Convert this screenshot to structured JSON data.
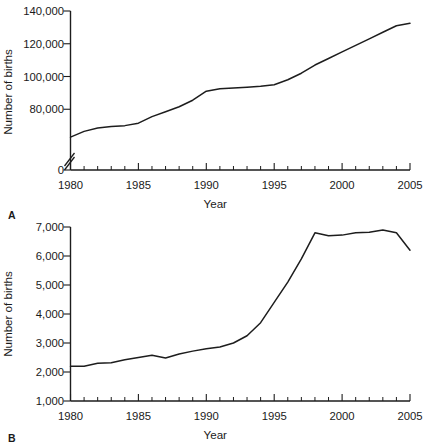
{
  "figure": {
    "background_color": "#ffffff",
    "line_color": "#1d1d1d",
    "panels": [
      {
        "letter": "A",
        "ylabel": "Number of births",
        "xlabel": "Year"
      },
      {
        "letter": "B",
        "ylabel": "Number of births",
        "xlabel": "Year"
      }
    ]
  },
  "chart_data": [
    {
      "type": "line",
      "panel": "A",
      "title": "",
      "xlabel": "Year",
      "ylabel": "Number of births",
      "xlim": [
        1980,
        2005
      ],
      "ylim": [
        0,
        140000
      ],
      "axis_break": true,
      "axis_break_note": "y-axis broken between 0 and the lowest plotted value",
      "grid": false,
      "legend": "none",
      "ytick_labels": [
        "140,000",
        "120,000",
        "100,000",
        "80,000",
        "0"
      ],
      "ytick_values": [
        140000,
        120000,
        100000,
        80000,
        0
      ],
      "xtick_labels": [
        "1980",
        "1985",
        "1990",
        "1995",
        "2000",
        "2005"
      ],
      "xtick_values": [
        1980,
        1985,
        1990,
        1995,
        2000,
        2005
      ],
      "xtick_minor_step": 1,
      "x": [
        1980,
        1981,
        1982,
        1983,
        1984,
        1985,
        1986,
        1987,
        1988,
        1989,
        1990,
        1991,
        1992,
        1993,
        1994,
        1995,
        1996,
        1997,
        1998,
        1999,
        2000,
        2001,
        2002,
        2003,
        2004,
        2005
      ],
      "values": [
        63000,
        66500,
        68500,
        69500,
        70000,
        71500,
        75500,
        78500,
        81500,
        85500,
        91000,
        92500,
        93000,
        93500,
        94000,
        95000,
        98000,
        102000,
        107000,
        111000,
        115000,
        119000,
        123000,
        127000,
        131000,
        132500
      ]
    },
    {
      "type": "line",
      "panel": "B",
      "title": "",
      "xlabel": "Year",
      "ylabel": "Number of births",
      "xlim": [
        1980,
        2005
      ],
      "ylim": [
        1000,
        7000
      ],
      "axis_break": false,
      "grid": false,
      "legend": "none",
      "ytick_labels": [
        "7,000",
        "6,000",
        "5,000",
        "4,000",
        "3,000",
        "2,000",
        "1,000"
      ],
      "ytick_values": [
        7000,
        6000,
        5000,
        4000,
        3000,
        2000,
        1000
      ],
      "xtick_labels": [
        "1980",
        "1985",
        "1990",
        "1995",
        "2000",
        "2005"
      ],
      "xtick_values": [
        1980,
        1985,
        1990,
        1995,
        2000,
        2005
      ],
      "xtick_minor_step": 1,
      "x": [
        1980,
        1981,
        1982,
        1983,
        1984,
        1985,
        1986,
        1987,
        1988,
        1989,
        1990,
        1991,
        1992,
        1993,
        1994,
        1995,
        1996,
        1997,
        1998,
        1999,
        2000,
        2001,
        2002,
        2003,
        2004,
        2005
      ],
      "values": [
        2200,
        2200,
        2300,
        2320,
        2420,
        2500,
        2580,
        2480,
        2620,
        2720,
        2800,
        2860,
        3000,
        3250,
        3700,
        4400,
        5100,
        5900,
        6800,
        6700,
        6720,
        6800,
        6820,
        6900,
        6800,
        6200
      ]
    }
  ]
}
